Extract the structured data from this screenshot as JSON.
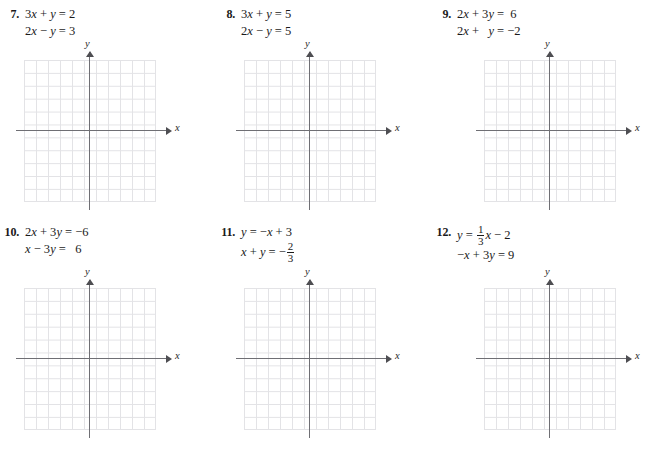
{
  "worksheet": {
    "axis_labels": {
      "x": "x",
      "y": "y"
    },
    "problems": [
      {
        "number": "7.",
        "lines": [
          {
            "segments": [
              {
                "t": "text",
                "v": "3"
              },
              {
                "t": "var",
                "v": "x"
              },
              {
                "t": "text",
                "v": " + "
              },
              {
                "t": "var",
                "v": "y"
              },
              {
                "t": "text",
                "v": " = 2"
              }
            ]
          },
          {
            "segments": [
              {
                "t": "text",
                "v": "2"
              },
              {
                "t": "var",
                "v": "x"
              },
              {
                "t": "text",
                "v": " − "
              },
              {
                "t": "var",
                "v": "y"
              },
              {
                "t": "text",
                "v": " = 3"
              }
            ]
          }
        ]
      },
      {
        "number": "8.",
        "lines": [
          {
            "segments": [
              {
                "t": "text",
                "v": "3"
              },
              {
                "t": "var",
                "v": "x"
              },
              {
                "t": "text",
                "v": " + "
              },
              {
                "t": "var",
                "v": "y"
              },
              {
                "t": "text",
                "v": " = 5"
              }
            ]
          },
          {
            "segments": [
              {
                "t": "text",
                "v": "2"
              },
              {
                "t": "var",
                "v": "x"
              },
              {
                "t": "text",
                "v": " − "
              },
              {
                "t": "var",
                "v": "y"
              },
              {
                "t": "text",
                "v": " = 5"
              }
            ]
          }
        ]
      },
      {
        "number": "9.",
        "lines": [
          {
            "segments": [
              {
                "t": "text",
                "v": "2"
              },
              {
                "t": "var",
                "v": "x"
              },
              {
                "t": "text",
                "v": " + 3"
              },
              {
                "t": "var",
                "v": "y"
              },
              {
                "t": "text",
                "v": " =  6"
              }
            ]
          },
          {
            "segments": [
              {
                "t": "text",
                "v": "2"
              },
              {
                "t": "var",
                "v": "x"
              },
              {
                "t": "text",
                "v": " +   "
              },
              {
                "t": "var",
                "v": "y"
              },
              {
                "t": "text",
                "v": " = −2"
              }
            ]
          }
        ]
      },
      {
        "number": "10.",
        "lines": [
          {
            "segments": [
              {
                "t": "text",
                "v": "2"
              },
              {
                "t": "var",
                "v": "x"
              },
              {
                "t": "text",
                "v": " + 3"
              },
              {
                "t": "var",
                "v": "y"
              },
              {
                "t": "text",
                "v": " = −6"
              }
            ]
          },
          {
            "segments": [
              {
                "t": "text",
                "v": "  "
              },
              {
                "t": "var",
                "v": "x"
              },
              {
                "t": "text",
                "v": " − 3"
              },
              {
                "t": "var",
                "v": "y"
              },
              {
                "t": "text",
                "v": " =   6"
              }
            ]
          }
        ]
      },
      {
        "number": "11.",
        "lines": [
          {
            "segments": [
              {
                "t": "text",
                "v": "      "
              },
              {
                "t": "var",
                "v": "y"
              },
              {
                "t": "text",
                "v": " = −"
              },
              {
                "t": "var",
                "v": "x"
              },
              {
                "t": "text",
                "v": " + 3"
              }
            ]
          },
          {
            "segments": [
              {
                "t": "var",
                "v": "x"
              },
              {
                "t": "text",
                "v": " + "
              },
              {
                "t": "var",
                "v": "y"
              },
              {
                "t": "text",
                "v": " = −"
              },
              {
                "t": "frac",
                "num": "2",
                "den": "3"
              }
            ]
          }
        ]
      },
      {
        "number": "12.",
        "lines": [
          {
            "segments": [
              {
                "t": "text",
                "v": "      "
              },
              {
                "t": "var",
                "v": "y"
              },
              {
                "t": "text",
                "v": " = "
              },
              {
                "t": "frac",
                "num": "1",
                "den": "3"
              },
              {
                "t": "var",
                "v": "x"
              },
              {
                "t": "text",
                "v": " − 2"
              }
            ]
          },
          {
            "segments": [
              {
                "t": "text",
                "v": "−"
              },
              {
                "t": "var",
                "v": "x"
              },
              {
                "t": "text",
                "v": " + 3"
              },
              {
                "t": "var",
                "v": "y"
              },
              {
                "t": "text",
                "v": " = 9"
              }
            ]
          }
        ]
      }
    ],
    "grid": {
      "columns": 11,
      "rows": 11,
      "line_color": "#e3e3e6",
      "axis_color": "#6f6f74"
    }
  }
}
